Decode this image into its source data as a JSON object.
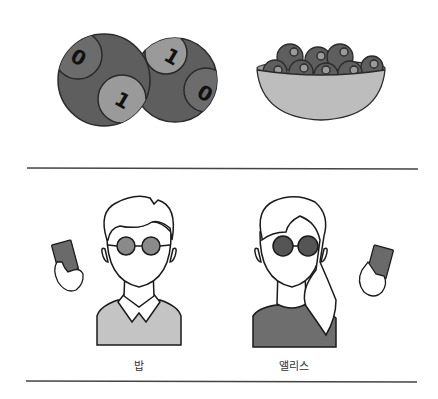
{
  "top_panel": {
    "balls": [
      {
        "cx": 104,
        "cy": 80,
        "r": 46,
        "spots": [
          {
            "digit": "0",
            "cx": 81,
            "cy": 58,
            "r": 21
          },
          {
            "digit": "1",
            "cx": 120,
            "cy": 98,
            "r": 24
          }
        ]
      },
      {
        "cx": 175,
        "cy": 80,
        "r": 42,
        "spots": [
          {
            "digit": "1",
            "cx": 166,
            "cy": 53,
            "r": 21
          },
          {
            "digit": "0",
            "cx": 198,
            "cy": 90,
            "r": 20
          }
        ]
      }
    ],
    "bowl": {
      "name": "bowl-of-balls"
    }
  },
  "people": [
    {
      "name": "bob",
      "label": "밥",
      "glasses_color": "#8a8a8a",
      "sweater_color": "#c4c4c4"
    },
    {
      "name": "alice",
      "label": "앨리스",
      "glasses_color": "#555555",
      "sweater_color": "#6e6e6e"
    }
  ],
  "colors": {
    "ball_dark": "#5e5e5e",
    "spot_light": "#9a9a9a",
    "spot_dark": "#6c6c6c",
    "bowl": "#bdbdbd",
    "card": "#6a6a6a",
    "line": "#444444"
  }
}
